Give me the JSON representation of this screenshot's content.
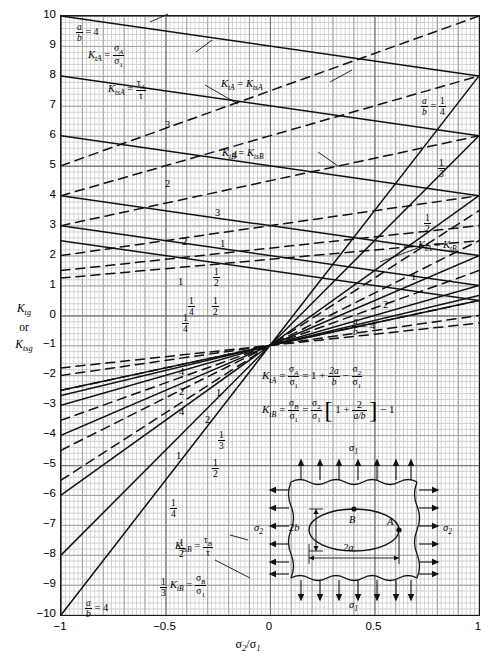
{
  "chart_data": {
    "type": "line",
    "xlabel": "σ2/σ1",
    "ylabel": "Ktg or Ktsg",
    "xlim": [
      -1,
      1
    ],
    "ylim": [
      -10,
      10
    ],
    "xticks": [
      -1,
      -0.5,
      0,
      0.5,
      1
    ],
    "yticks": [
      10,
      9,
      8,
      7,
      6,
      5,
      4,
      3,
      2,
      1,
      0,
      -1,
      -2,
      -3,
      -4,
      -5,
      -6,
      -7,
      -8,
      -9,
      -10
    ],
    "grid": true,
    "legend_position": "inline-annotations",
    "series": [
      {
        "name": "KtA, a/b = 4",
        "style": "solid",
        "ab": 4,
        "formula": "1 + 2a/b - s2/s1",
        "x": [
          -1,
          1
        ],
        "values": [
          10,
          8
        ]
      },
      {
        "name": "KtA, a/b = 3",
        "style": "solid",
        "ab": 3,
        "x": [
          -1,
          1
        ],
        "values": [
          8,
          6
        ]
      },
      {
        "name": "KtA, a/b = 2",
        "style": "solid",
        "ab": 2,
        "x": [
          -1,
          1
        ],
        "values": [
          6,
          4
        ]
      },
      {
        "name": "KtA, a/b = 1",
        "style": "solid",
        "ab": 1,
        "x": [
          -1,
          1
        ],
        "values": [
          4,
          2
        ]
      },
      {
        "name": "KtA, a/b = 1/2",
        "style": "solid",
        "ab": 0.5,
        "x": [
          -1,
          1
        ],
        "values": [
          3,
          1
        ]
      },
      {
        "name": "KtA, a/b = 1/4",
        "style": "solid",
        "ab": 0.25,
        "x": [
          -1,
          1
        ],
        "values": [
          2.5,
          0.5
        ]
      },
      {
        "name": "KtsA, a/b = 4",
        "style": "dashed",
        "ab": 4,
        "x": [
          -1,
          1
        ],
        "values": [
          5,
          10
        ]
      },
      {
        "name": "KtsA, a/b = 3",
        "style": "dashed",
        "ab": 3,
        "x": [
          -1,
          1
        ],
        "values": [
          4,
          8
        ]
      },
      {
        "name": "KtsA, a/b = 2",
        "style": "dashed",
        "ab": 2,
        "x": [
          -1,
          1
        ],
        "values": [
          3,
          6
        ]
      },
      {
        "name": "KtsA, a/b = 1",
        "style": "dashed",
        "ab": 1,
        "x": [
          -1,
          1
        ],
        "values": [
          2,
          4
        ]
      },
      {
        "name": "KtsA, a/b = 1/2",
        "style": "dashed",
        "ab": 0.5,
        "x": [
          -1,
          1
        ],
        "values": [
          1.5,
          3
        ]
      },
      {
        "name": "KtsA, a/b = 1/4",
        "style": "dashed",
        "ab": 0.25,
        "x": [
          -1,
          1
        ],
        "values": [
          1.25,
          2.5
        ]
      },
      {
        "name": "KtB, a/b = 4",
        "style": "solid",
        "ab": 4,
        "formula": "s2/s1*(1+2/(a/b)) - 1",
        "x": [
          -1,
          1
        ],
        "values": [
          -2.5,
          0.5
        ]
      },
      {
        "name": "KtB, a/b = 3",
        "style": "solid",
        "ab": 3,
        "x": [
          -1,
          1
        ],
        "values": [
          -2.67,
          0.67
        ]
      },
      {
        "name": "KtB, a/b = 2",
        "style": "solid",
        "ab": 2,
        "x": [
          -1,
          1
        ],
        "values": [
          -3,
          1
        ]
      },
      {
        "name": "KtB, a/b = 1",
        "style": "solid",
        "ab": 1,
        "x": [
          -1,
          1
        ],
        "values": [
          -4,
          2
        ]
      },
      {
        "name": "KtB, a/b = 1/2",
        "style": "solid",
        "ab": 0.5,
        "x": [
          -1,
          1
        ],
        "values": [
          -6,
          4
        ]
      },
      {
        "name": "KtB, a/b = 1/3",
        "style": "solid",
        "ab": 0.3333,
        "x": [
          -1,
          1
        ],
        "values": [
          -8,
          6
        ]
      },
      {
        "name": "KtB, a/b = 1/4",
        "style": "solid",
        "ab": 0.25,
        "x": [
          -1,
          1
        ],
        "values": [
          -10,
          8
        ]
      },
      {
        "name": "KtsB, a/b = 4",
        "style": "dashed",
        "ab": 4,
        "x": [
          -1,
          1
        ],
        "values": [
          -1.75,
          -0.25
        ]
      },
      {
        "name": "KtsB, a/b = 2",
        "style": "dashed",
        "ab": 2,
        "x": [
          -1,
          1
        ],
        "values": [
          -2,
          0
        ]
      },
      {
        "name": "KtsB, a/b = 1",
        "style": "dashed",
        "ab": 1,
        "x": [
          -1,
          1
        ],
        "values": [
          -2.5,
          0.5
        ]
      },
      {
        "name": "KtsB, a/b = 1/2",
        "style": "dashed",
        "ab": 0.5,
        "x": [
          -1,
          1
        ],
        "values": [
          -3.5,
          1.5
        ]
      },
      {
        "name": "KtsB, a/b = 1/3",
        "style": "dashed",
        "ab": 0.3333,
        "x": [
          -1,
          1
        ],
        "values": [
          -4.5,
          2.5
        ]
      },
      {
        "name": "KtsB, a/b = 1/4",
        "style": "dashed",
        "ab": 0.25,
        "x": [
          -1,
          1
        ],
        "values": [
          -5.5,
          3.5
        ]
      }
    ]
  },
  "axes": {
    "y_title_line1": "K",
    "y_title_sub1": "tg",
    "y_title_line2": "or",
    "y_title_line3": "K",
    "y_title_sub3": "tsg",
    "x_title_main": "σ",
    "x_title_sub_a": "2",
    "x_title_slash": "/σ",
    "x_title_sub_b": "1",
    "yticks": [
      "10",
      "9",
      "8",
      "7",
      "6",
      "5",
      "4",
      "3",
      "2",
      "1",
      "0",
      "−1",
      "−2",
      "−3",
      "−4",
      "−5",
      "−6",
      "−7",
      "−8",
      "−9",
      "−10"
    ],
    "xticks": [
      "−1",
      "−0.5",
      "0",
      "0.5",
      "1"
    ]
  },
  "annotations": {
    "ab_top_left": {
      "label_a": "a",
      "label_b": "b",
      "eq": "= 4"
    },
    "ktA_def": {
      "k": "K",
      "sub": "tA",
      "eq": "=",
      "num": "σ",
      "num_sub": "A",
      "den": "σ",
      "den_sub": "1"
    },
    "ktsA_def": {
      "k": "K",
      "sub": "tsA",
      "eq": "=",
      "num": "τ",
      "num_sub": "A",
      "den": "τ"
    },
    "ktA_eq_ktsA": {
      "left_k": "K",
      "left_sub": "tA",
      "eq": "=",
      "right_k": "K",
      "right_sub": "tsA"
    },
    "ktB_eq_ktsB": {
      "left_k": "K",
      "left_sub": "tB",
      "eq": "=",
      "right_k": "K",
      "right_sub": "tsB"
    },
    "ktA_eq_ktB": {
      "left_k": "K",
      "left_sub": "tA",
      "eq": "=",
      "right_k": "K",
      "right_sub": "tB"
    },
    "ktsB_def": {
      "k": "K",
      "sub": "tsB",
      "eq": "=",
      "num": "τ",
      "num_sub": "B",
      "den": "τ"
    },
    "ktB_def": {
      "k": "K",
      "sub": "tB",
      "eq": "=",
      "num": "σ",
      "num_sub": "B",
      "den": "σ",
      "den_sub": "1"
    },
    "ab_bottom_left": {
      "label_a": "a",
      "label_b": "b",
      "eq": "= 4"
    },
    "ab_bottom_right": {
      "label_a": "a",
      "label_b": "b",
      "eq": "= 4"
    },
    "ab_right_quarter": {
      "label_a": "a",
      "label_b": "b",
      "eq": "=",
      "fn": "1",
      "fd": "4"
    },
    "right_third": {
      "n": "1",
      "d": "3"
    },
    "right_half": {
      "n": "1",
      "d": "2"
    },
    "right_one": "1",
    "right_two": "2",
    "right_three": "3"
  },
  "equations": {
    "eq1": {
      "k": "K",
      "sub": "tA",
      "eq1": "=",
      "f1n": "σ",
      "f1n_sub": "A",
      "f1d": "σ",
      "f1d_sub": "1",
      "eq2": "= 1 +",
      "f2n": "2a",
      "f2d": "b",
      "minus": "−",
      "f3n": "σ",
      "f3n_sub": "2",
      "f3d": "σ",
      "f3d_sub": "1"
    },
    "eq2": {
      "k": "K",
      "sub": "tB",
      "eq1": "=",
      "f1n": "σ",
      "f1n_sub": "B",
      "f1d": "σ",
      "f1d_sub": "1",
      "eq2": "=",
      "f2n": "σ",
      "f2n_sub": "2",
      "f2d": "σ",
      "f2d_sub": "1",
      "brk_open": "[",
      "one_plus": "1 +",
      "f3n": "2",
      "f3d": "a/b",
      "brk_close": "]",
      "tail": "− 1"
    }
  },
  "inset": {
    "sigma1_top": "σ",
    "sigma1_top_sub": "1",
    "sigma1_bottom": "σ",
    "sigma1_bottom_sub": "1",
    "sigma2_left": "σ",
    "sigma2_left_sub": "2",
    "sigma2_right": "σ",
    "sigma2_right_sub": "2",
    "dim_2b": "2b",
    "dim_2a": "2a",
    "point_A": "A",
    "point_B": "B"
  },
  "curve_labels": {
    "upper_left": [
      "3",
      "4",
      "2",
      "3",
      "1",
      "2",
      "1/2",
      "1/4",
      "1",
      "1/2",
      "1/4"
    ],
    "lower_left": [
      "4",
      "2",
      "1",
      "4",
      "2",
      "1/3",
      "1",
      "1/2",
      "1/4",
      "1/2",
      "1/3"
    ]
  },
  "colors": {
    "ink": "#1a1a1a",
    "grid_minor": "#c9c9c9",
    "grid_mid": "#a2a2a2",
    "grid_major": "#6e6e6e",
    "background": "#ffffff"
  }
}
